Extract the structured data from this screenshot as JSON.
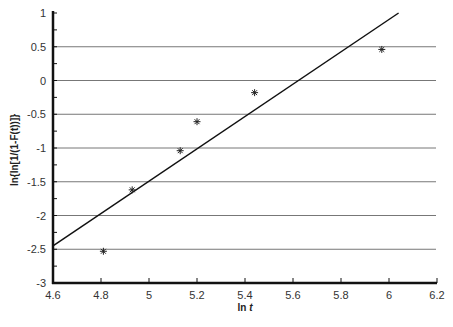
{
  "chart_data": {
    "type": "scatter",
    "title": "",
    "xlabel": "ln t",
    "ylabel": "ln{ln[1/(1-F(t))]}",
    "xlim": [
      4.6,
      6.2
    ],
    "ylim": [
      -3,
      1
    ],
    "x_ticks": [
      "4.6",
      "4.8",
      "5",
      "5.2",
      "5.4",
      "5.6",
      "5.8",
      "6",
      "6.2"
    ],
    "y_ticks": [
      "1",
      "0.5",
      "0",
      "-0.5",
      "-1",
      "-1.5",
      "-2",
      "-2.5",
      "-3"
    ],
    "grid": {
      "horizontal": true,
      "vertical": false
    },
    "series": [
      {
        "name": "data",
        "marker": "asterisk",
        "points": [
          {
            "x": 4.81,
            "y": -2.53
          },
          {
            "x": 4.93,
            "y": -1.62
          },
          {
            "x": 5.13,
            "y": -1.04
          },
          {
            "x": 5.2,
            "y": -0.61
          },
          {
            "x": 5.44,
            "y": -0.18
          },
          {
            "x": 5.97,
            "y": 0.46
          }
        ]
      },
      {
        "name": "fit line",
        "type": "line",
        "points": [
          {
            "x": 4.6,
            "y": -2.45
          },
          {
            "x": 6.04,
            "y": 1.0
          }
        ]
      }
    ]
  }
}
